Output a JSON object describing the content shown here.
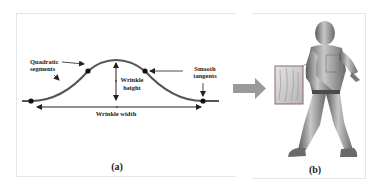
{
  "figure": {
    "panel_a": {
      "caption": "(a)",
      "labels": {
        "quadratic_line1": "Quadratic",
        "quadratic_line2": "segments",
        "smooth_line1": "Smooth",
        "smooth_line2": "tangents",
        "height_line1": "Wrinkle",
        "height_line2": "height",
        "width": "Wrinkle width"
      },
      "colors": {
        "curve": "#555555",
        "points": "#111111",
        "arrows": "#222222"
      }
    },
    "transition_arrow": {
      "color": "#9a9a9a"
    },
    "panel_b": {
      "caption": "(b)",
      "inset_border_color": "#8a6a6a",
      "figure_color": "#8e8e8e"
    }
  }
}
